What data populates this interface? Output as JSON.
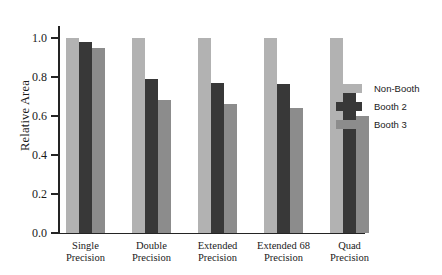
{
  "chart_data": {
    "type": "bar",
    "title": "",
    "xlabel": "",
    "ylabel": "Relative Area",
    "ylim": [
      0.0,
      1.05
    ],
    "yticks": [
      "0.0",
      "0.2",
      "0.4",
      "0.6",
      "0.8",
      "1.0"
    ],
    "ytick_values": [
      0.0,
      0.2,
      0.4,
      0.6,
      0.8,
      1.0
    ],
    "grid": false,
    "legend_position": "right",
    "categories": [
      "Single Precision",
      "Double Precision",
      "Extended Precision",
      "Extended 68 Precision",
      "Quad Precision"
    ],
    "categories_lines": [
      [
        "Single",
        "Precision"
      ],
      [
        "Double",
        "Precision"
      ],
      [
        "Extended",
        "Precision"
      ],
      [
        "Extended 68",
        "Precision"
      ],
      [
        "Quad",
        "Precision"
      ]
    ],
    "series": [
      {
        "name": "Non-Booth",
        "color": "#b2b2b2",
        "values": [
          1.0,
          1.0,
          1.0,
          1.0,
          1.0
        ]
      },
      {
        "name": "Booth 2",
        "color": "#383838",
        "values": [
          0.98,
          0.79,
          0.77,
          0.765,
          0.72
        ]
      },
      {
        "name": "Booth 3",
        "color": "#8c8c8c",
        "values": [
          0.95,
          0.68,
          0.66,
          0.64,
          0.6
        ]
      }
    ]
  },
  "axis": {
    "y_title": "Relative Area"
  }
}
